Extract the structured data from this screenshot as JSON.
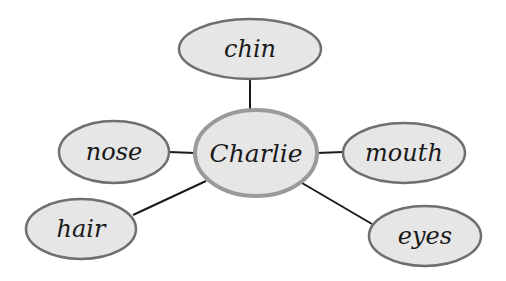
{
  "diagram": {
    "type": "mind-map",
    "center": {
      "label": "Charlie",
      "cx": 256,
      "cy": 153,
      "rx": 61,
      "ry": 43,
      "fill": "#e6e6e6",
      "stroke": "#9a9a9a",
      "stroke_width": 4,
      "font_size": 25
    },
    "nodes": [
      {
        "id": "chin",
        "label": "chin",
        "cx": 250,
        "cy": 49,
        "rx": 71,
        "ry": 30,
        "anchor_x": 250,
        "anchor_y": 79,
        "end_x": 250,
        "end_y": 111,
        "font_size": 24
      },
      {
        "id": "nose",
        "label": "nose",
        "cx": 114,
        "cy": 152,
        "rx": 55,
        "ry": 31,
        "anchor_x": 169,
        "anchor_y": 152,
        "end_x": 195,
        "end_y": 153,
        "font_size": 24
      },
      {
        "id": "mouth",
        "label": "mouth",
        "cx": 404,
        "cy": 153,
        "rx": 61,
        "ry": 30,
        "anchor_x": 343,
        "anchor_y": 152,
        "end_x": 317,
        "end_y": 153,
        "font_size": 24
      },
      {
        "id": "hair",
        "label": "hair",
        "cx": 81,
        "cy": 229,
        "rx": 55,
        "ry": 30,
        "anchor_x": 133,
        "anchor_y": 215,
        "end_x": 206,
        "end_y": 181,
        "font_size": 24
      },
      {
        "id": "eyes",
        "label": "eyes",
        "cx": 425,
        "cy": 236,
        "rx": 56,
        "ry": 30,
        "anchor_x": 372,
        "anchor_y": 224,
        "end_x": 302,
        "end_y": 183,
        "font_size": 24
      }
    ],
    "style": {
      "node_fill": "#e6e6e6",
      "node_stroke": "#6f6f6f",
      "node_stroke_width": 2.5,
      "connector_color": "#1a1a1a",
      "connector_width": 2
    }
  }
}
